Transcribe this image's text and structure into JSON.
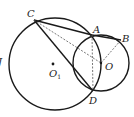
{
  "diagram": {
    "points": {
      "C": {
        "label": "C",
        "x": 34,
        "y": 20
      },
      "A": {
        "label": "A",
        "x": 92,
        "y": 35
      },
      "B": {
        "label": "B",
        "x": 121,
        "y": 40
      },
      "O": {
        "label": "O",
        "x": 101,
        "y": 63
      },
      "D": {
        "label": "D",
        "x": 93,
        "y": 91
      },
      "O1": {
        "label": "O",
        "sub": "1",
        "x": 53,
        "y": 64
      }
    },
    "circles": [
      {
        "name": "circle-O1",
        "cx": 55,
        "cy": 64,
        "r": 46
      },
      {
        "name": "circle-O",
        "cx": 101,
        "cy": 63,
        "r": 28
      }
    ],
    "solid_segments": [
      "CA",
      "AB",
      "CD"
    ],
    "dashed_segments": [
      "CO",
      "AD",
      "OB"
    ],
    "edge_glyph": "J",
    "colors": {
      "stroke": "#1a1a1a",
      "dashed": "#555555"
    }
  }
}
